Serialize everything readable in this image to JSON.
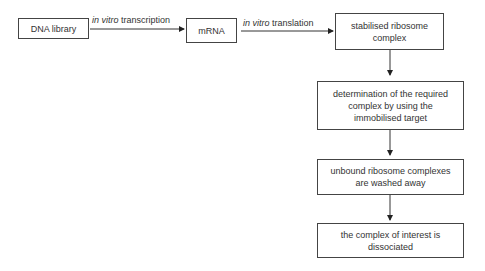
{
  "diagram": {
    "type": "flowchart",
    "nodes": [
      {
        "id": "dna",
        "label": "DNA library"
      },
      {
        "id": "mrna",
        "label": "mRNA"
      },
      {
        "id": "complex",
        "label": "stabilised ribosome complex"
      },
      {
        "id": "determination",
        "label": "determination of the required complex by using the immobilised target"
      },
      {
        "id": "wash",
        "label": "unbound ribosome complexes are washed away"
      },
      {
        "id": "dissociate",
        "label": "the complex of interest is dissociated"
      }
    ],
    "edges": [
      {
        "from": "dna",
        "to": "mrna",
        "label_italic": "in vitro",
        "label_rest": " transcription"
      },
      {
        "from": "mrna",
        "to": "complex",
        "label_italic": "in vitro",
        "label_rest": " translation"
      },
      {
        "from": "complex",
        "to": "determination"
      },
      {
        "from": "determination",
        "to": "wash"
      },
      {
        "from": "wash",
        "to": "dissociate"
      }
    ]
  }
}
